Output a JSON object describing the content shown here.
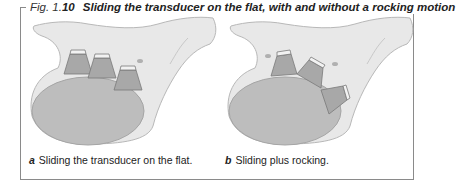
{
  "figure": {
    "prefix": "Fig. 1.",
    "number": "10",
    "title": "Sliding the transducer on the flat, with and without a rocking motion"
  },
  "panels": [
    {
      "letter": "a",
      "caption": "Sliding the transducer on the flat."
    },
    {
      "letter": "b",
      "caption": "Sliding plus rocking."
    }
  ],
  "colors": {
    "frame": "#8a8a8a",
    "body_light": "#e6e6e6",
    "organ": "#bdbdbd",
    "transducer": "#a8a8a8"
  }
}
